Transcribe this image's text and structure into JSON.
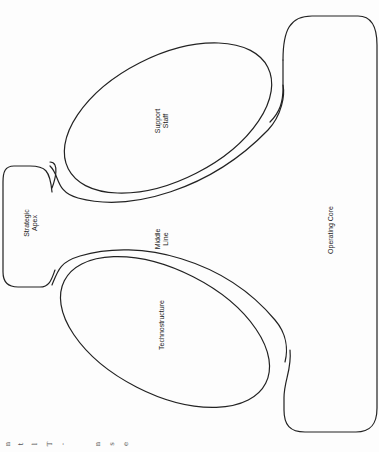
{
  "diagram": {
    "orientation": "rotated -90deg",
    "stroke_color": "#222222",
    "background": "#fdfdfd",
    "parts": [
      {
        "id": "strategic-apex",
        "label": "Strategic\nApex",
        "shape": "rounded-rect"
      },
      {
        "id": "middle-line",
        "label": "Middle\nLine",
        "shape": "channel"
      },
      {
        "id": "support-staff",
        "label": "Support\nStaff",
        "shape": "ellipse"
      },
      {
        "id": "technostructure",
        "label": "Technostructure",
        "shape": "ellipse"
      },
      {
        "id": "operating-core",
        "label": "Operating Core",
        "shape": "rounded-rect"
      }
    ],
    "edges": [
      {
        "from": "strategic-apex",
        "to": "middle-line"
      },
      {
        "from": "middle-line",
        "to": "operating-core"
      }
    ]
  },
  "labels": {
    "strategic_apex": "Strategic\nApex",
    "middle_line": "Middle\nLine",
    "support_staff": "Support\nStaff",
    "technostructure": "Technostructure",
    "operating_core": "Operating Core"
  },
  "margin_fragments": [
    "n",
    "t",
    "l",
    "T",
    "-",
    "n",
    "s",
    "e",
    "n",
    "n"
  ]
}
